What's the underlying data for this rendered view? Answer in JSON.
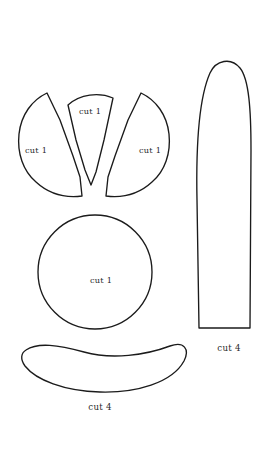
{
  "document": {
    "kind": "sewing-pattern-template",
    "title": "Pattern Pieces",
    "background_color": "#ffffff",
    "line_color": "#1b1b1b",
    "text_color": "#2a2a2a"
  },
  "pieces": [
    {
      "id": "left-petal",
      "shape": "circle-sector-petal",
      "label": "cut 1",
      "label_x": 36,
      "label_y": 153,
      "quantity": 1
    },
    {
      "id": "center-wedge",
      "shape": "triangular-wedge-with-curved-top",
      "label": "cut 1",
      "label_x": 90,
      "label_y": 114,
      "quantity": 1
    },
    {
      "id": "right-petal",
      "shape": "circle-sector-petal",
      "label": "cut 1",
      "label_x": 139,
      "label_y": 153,
      "quantity": 1
    },
    {
      "id": "center-circle",
      "shape": "circle",
      "label": "cut 1",
      "label_x": 94,
      "label_y": 283,
      "quantity": 1
    },
    {
      "id": "long-leaf",
      "shape": "elongated-rounded-leaf",
      "label": "cut 4",
      "label_x": 229,
      "label_y": 351,
      "quantity": 4
    },
    {
      "id": "crescent-strip",
      "shape": "crescent-banana",
      "label": "cut 4",
      "label_x": 100,
      "label_y": 410,
      "quantity": 4
    }
  ]
}
